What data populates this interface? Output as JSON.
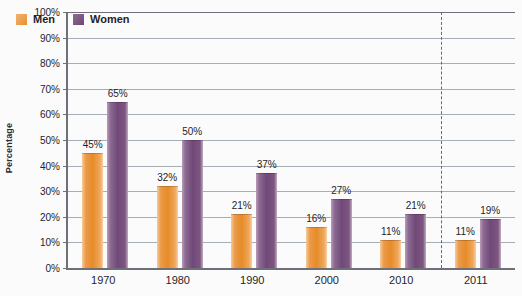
{
  "chart_data": {
    "type": "bar",
    "title": "",
    "subtitle": "",
    "xlabel": "",
    "ylabel": "Percentage",
    "ylim": [
      0,
      100
    ],
    "y_tick_labels": [
      "0%",
      "10%",
      "20%",
      "30%",
      "40%",
      "50%",
      "60%",
      "70%",
      "80%",
      "90%",
      "100%"
    ],
    "y_tick_values": [
      0,
      10,
      20,
      30,
      40,
      50,
      60,
      70,
      80,
      90,
      100
    ],
    "grid": true,
    "legend_position": "top-left-inside",
    "categories": [
      "1970",
      "1980",
      "1990",
      "2000",
      "2010",
      "2011"
    ],
    "series": [
      {
        "name": "Men",
        "color": "#e8912f",
        "values": [
          45,
          32,
          21,
          16,
          11,
          11
        ],
        "data_labels": [
          "45%",
          "32%",
          "21%",
          "16%",
          "11%",
          "11%"
        ]
      },
      {
        "name": "Women",
        "color": "#70497a",
        "values": [
          65,
          50,
          37,
          27,
          21,
          19
        ],
        "data_labels": [
          "65%",
          "50%",
          "37%",
          "27%",
          "21%",
          "19%"
        ]
      }
    ],
    "annotations": [
      {
        "type": "vertical-dashed-line",
        "name": "category-divider",
        "after_category": "2010",
        "color": "#5b6b82"
      }
    ]
  },
  "legend": {
    "items": [
      {
        "label": "Men",
        "swatch": "men"
      },
      {
        "label": "Women",
        "swatch": "women"
      }
    ]
  },
  "axes": {
    "y_title": "Percentage"
  }
}
